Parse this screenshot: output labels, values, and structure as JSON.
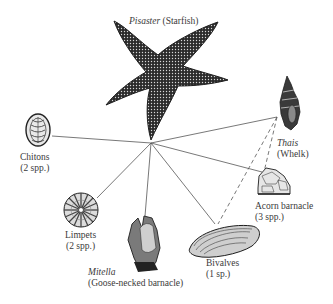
{
  "predator_top": {
    "genus": "Pisaster",
    "common": "(Starfish)"
  },
  "predator_secondary": {
    "genus": "Thais",
    "common": "(Whelk)"
  },
  "prey": [
    {
      "name": "Chitons",
      "count": "(2 spp.)"
    },
    {
      "name": "Limpets",
      "count": "(2 spp.)"
    },
    {
      "genus": "Mitella",
      "name": "(Goose-necked barnacle)"
    },
    {
      "name": "Bivalves",
      "count": "(1 sp.)"
    },
    {
      "name": "Acorn barnacle",
      "count": "(3 spp.)"
    }
  ],
  "links": {
    "solid": [
      "Pisaster-Thais",
      "Pisaster-Chitons",
      "Pisaster-Limpets",
      "Pisaster-Mitella",
      "Pisaster-Bivalves",
      "Pisaster-Acorn barnacle"
    ],
    "dashed": [
      "Thais-Bivalves",
      "Thais-Acorn barnacle"
    ]
  },
  "colors": {
    "line": "#555555",
    "ink": "#2a2a2a",
    "background": "#ffffff"
  }
}
